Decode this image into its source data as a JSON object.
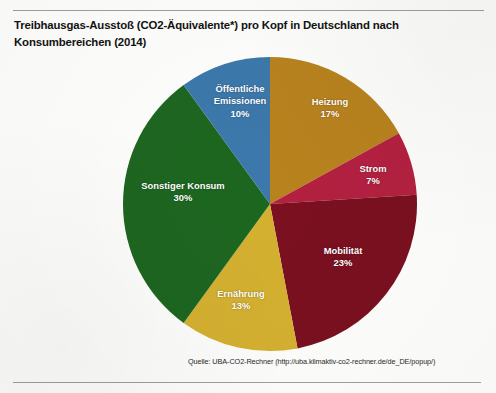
{
  "figure": {
    "title": "Treibhausgas-Ausstoß (CO2-Äquivalente*) pro Kopf in Deutschland nach Konsumbereichen (2014)",
    "source": "Quelle: UBA-CO2-Rechner (http://uba.klimaktiv-co2-rechner.de/de_DE/popup/)"
  },
  "chart_data": {
    "type": "pie",
    "title": "Treibhausgas-Ausstoß (CO2-Äquivalente*) pro Kopf in Deutschland nach Konsumbereichen (2014)",
    "xlabel": "",
    "ylabel": "",
    "unit": "%",
    "start_angle_deg": 0,
    "direction": "clockwise",
    "legend": "none (labels drawn inside slices)",
    "grid": false,
    "categories": [
      "Heizung",
      "Strom",
      "Mobilität",
      "Ernährung",
      "Sonstiger Konsum",
      "Öffentliche Emissionen"
    ],
    "values": [
      17,
      7,
      23,
      13,
      30,
      10
    ],
    "colors": [
      "#b8821e",
      "#b32040",
      "#7a1020",
      "#d4b030",
      "#1d6620",
      "#3c78ab"
    ],
    "slices": [
      {
        "label": "Heizung",
        "value": 17,
        "display_value": "17%",
        "color": "#b8821e"
      },
      {
        "label": "Strom",
        "value": 7,
        "display_value": "7%",
        "color": "#b32040"
      },
      {
        "label": "Mobilität",
        "value": 23,
        "display_value": "23%",
        "color": "#7a1020"
      },
      {
        "label": "Ernährung",
        "value": 13,
        "display_value": "13%",
        "color": "#d4b030"
      },
      {
        "label": "Sonstiger Konsum",
        "value": 30,
        "display_value": "30%",
        "color": "#1d6620"
      },
      {
        "label": "Öffentliche Emissionen",
        "value": 10,
        "display_value": "10%",
        "color": "#3c78ab"
      }
    ]
  },
  "labels": {
    "heizung": {
      "name": "Heizung",
      "pct": "17%"
    },
    "strom": {
      "name": "Strom",
      "pct": "7%"
    },
    "mobilitaet": {
      "name": "Mobilität",
      "pct": "23%"
    },
    "ernaehrung": {
      "name": "Ernährung",
      "pct": "13%"
    },
    "sonstiger_konsum": {
      "name": "Sonstiger Konsum",
      "pct": "30%"
    },
    "oeffentliche_emissionen_line1": "Öffentliche",
    "oeffentliche_emissionen_line2": "Emissionen",
    "oeffentliche_emissionen_pct": "10%"
  }
}
